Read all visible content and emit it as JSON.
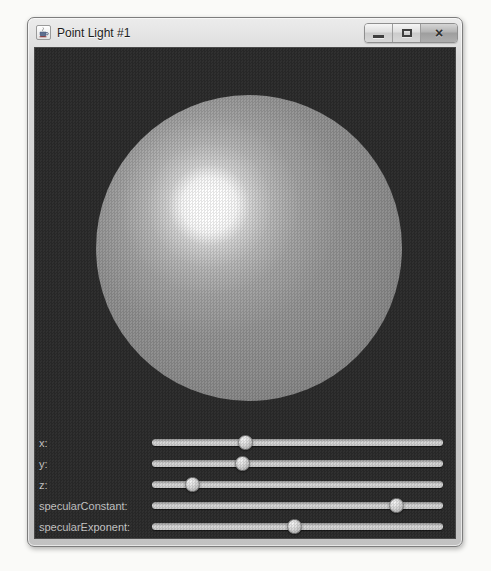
{
  "window": {
    "title": "Point Light #1",
    "app_icon": "java-coffee-cup-icon",
    "controls": [
      {
        "id": "minimize",
        "icon": "minimize-icon"
      },
      {
        "id": "maximize",
        "icon": "maximize-icon"
      },
      {
        "id": "close",
        "icon": "close-icon",
        "glyph": "×"
      }
    ]
  },
  "viewport": {
    "object": "sphere",
    "description": "gray sphere lit by a point light with white specular highlight in upper-left",
    "background_color": "#2b2b2b",
    "sphere_color": "#919191",
    "highlight_color": "#ffffff"
  },
  "sliders": [
    {
      "label": "x:",
      "value_pct": 32
    },
    {
      "label": "y:",
      "value_pct": 31
    },
    {
      "label": "z:",
      "value_pct": 14
    },
    {
      "label": "specularConstant:",
      "value_pct": 84
    },
    {
      "label": "specularExponent:",
      "value_pct": 49
    }
  ],
  "colors": {
    "titlebar": "#d9d9d9",
    "content_background": "#2b2b2b",
    "slider_label": "#c9c9c9",
    "slider_track": "#cfcfcf",
    "slider_thumb": "#d6d6d6"
  }
}
